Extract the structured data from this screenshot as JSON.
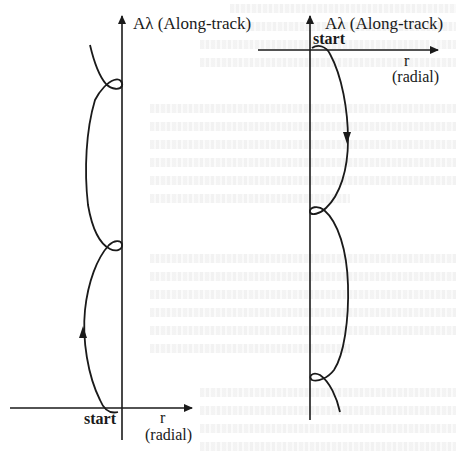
{
  "figure": {
    "left_panel": {
      "vertical_axis_label": "Aλ (Along-track)",
      "horizontal_axis_label": "r",
      "horizontal_axis_sublabel": "(radial)",
      "start_label": "start",
      "trajectory_direction": "upward"
    },
    "right_panel": {
      "vertical_axis_label": "Aλ (Along-track)",
      "horizontal_axis_label": "r",
      "horizontal_axis_sublabel": "(radial)",
      "start_label": "start",
      "trajectory_direction": "downward"
    }
  },
  "colors": {
    "line": "#1a1a1a",
    "background": "#ffffff",
    "faint_text": "#e6e6e6"
  }
}
